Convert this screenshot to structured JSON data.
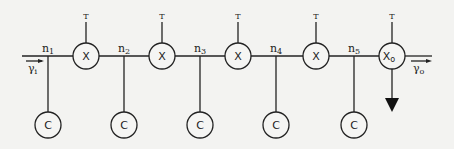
{
  "diagram": {
    "input_label": "γ",
    "input_sub": "i",
    "output_label": "γ",
    "output_sub": "o",
    "units": [
      {
        "node": "n",
        "node_sub": "1",
        "unit": "X",
        "unit_sub": "",
        "top": "T",
        "cell": "C"
      },
      {
        "node": "n",
        "node_sub": "2",
        "unit": "X",
        "unit_sub": "",
        "top": "T",
        "cell": "C"
      },
      {
        "node": "n",
        "node_sub": "3",
        "unit": "X",
        "unit_sub": "",
        "top": "T",
        "cell": "C"
      },
      {
        "node": "n",
        "node_sub": "4",
        "unit": "X",
        "unit_sub": "",
        "top": "T",
        "cell": "C"
      },
      {
        "node": "n",
        "node_sub": "5",
        "unit": "X",
        "unit_sub": "o",
        "top": "T",
        "cell": "C"
      }
    ]
  }
}
